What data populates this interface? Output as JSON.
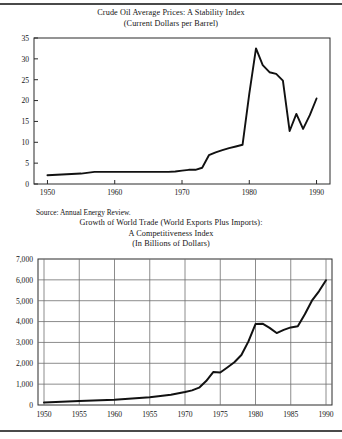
{
  "document": {
    "type": "scanned-report-page",
    "rules": {
      "top": true,
      "bottom": true
    }
  },
  "figure1": {
    "title_line1": "Crude Oil Average Prices: A Stability Index",
    "title_line2": "(Current Dollars per Barrel)",
    "source": "Source: Annual Energy Review."
  },
  "figure2": {
    "title_line1": "Growth of World Trade (World Exports Plus Imports):",
    "title_line2": "A Competitiveness Index",
    "title_line3": "(In Billions of Dollars)"
  },
  "chart_data": [
    {
      "type": "line",
      "title": "Crude Oil Average Prices: A Stability Index",
      "subtitle": "(Current Dollars per Barrel)",
      "xlabel": "",
      "ylabel": "",
      "xlim": [
        1948,
        1992
      ],
      "ylim": [
        0,
        35
      ],
      "grid": false,
      "ticks_inward": true,
      "legend": "none",
      "xticks": [
        1950,
        1960,
        1970,
        1980,
        1990
      ],
      "xtick_labels": [
        "1950",
        "1960",
        "1970",
        "1980",
        "1990"
      ],
      "yticks": [
        0,
        5,
        10,
        15,
        20,
        25,
        30,
        35
      ],
      "ytick_labels": [
        "0",
        "5",
        "10",
        "15",
        "20",
        "25",
        "30",
        "35"
      ],
      "series": [
        {
          "name": "Crude oil average price",
          "x": [
            1950,
            1955,
            1957,
            1960,
            1965,
            1968,
            1969,
            1970,
            1971,
            1972,
            1973,
            1974,
            1975,
            1976,
            1977,
            1978,
            1979,
            1980,
            1981,
            1982,
            1983,
            1984,
            1985,
            1986,
            1987,
            1988,
            1989,
            1990
          ],
          "values": [
            2.1,
            2.5,
            2.9,
            2.9,
            2.9,
            2.9,
            3.0,
            3.2,
            3.4,
            3.4,
            3.9,
            6.9,
            7.6,
            8.1,
            8.6,
            9.0,
            9.4,
            21.6,
            32.5,
            28.5,
            26.8,
            26.4,
            24.8,
            12.7,
            16.8,
            13.2,
            16.5,
            20.5
          ]
        }
      ]
    },
    {
      "type": "line",
      "title": "Growth of World Trade (World Exports Plus Imports): A Competitiveness Index",
      "subtitle": "(In Billions of Dollars)",
      "xlabel": "",
      "ylabel": "",
      "xlim": [
        1950,
        1990
      ],
      "ylim": [
        0,
        7000
      ],
      "grid": true,
      "legend": "none",
      "xticks": [
        1950,
        1955,
        1960,
        1965,
        1970,
        1975,
        1980,
        1985,
        1990
      ],
      "xtick_labels": [
        "1950",
        "1955",
        "1960",
        "1955",
        "1970",
        "1975",
        "1980",
        "1985",
        "1990"
      ],
      "yticks": [
        0,
        1000,
        2000,
        3000,
        4000,
        5000,
        6000,
        7000
      ],
      "ytick_labels": [
        "0",
        "1,000",
        "2,000",
        "3,000",
        "4,000",
        "5,000",
        "6,000",
        "7,000"
      ],
      "series": [
        {
          "name": "World exports plus imports",
          "x": [
            1950,
            1955,
            1960,
            1965,
            1968,
            1970,
            1971,
            1972,
            1973,
            1974,
            1975,
            1976,
            1977,
            1978,
            1979,
            1980,
            1981,
            1982,
            1983,
            1984,
            1985,
            1986,
            1987,
            1988,
            1989,
            1990
          ],
          "values": [
            120,
            190,
            255,
            375,
            490,
            620,
            700,
            830,
            1150,
            1580,
            1560,
            1800,
            2050,
            2400,
            3050,
            3880,
            3900,
            3700,
            3450,
            3600,
            3720,
            3780,
            4350,
            5000,
            5450,
            5980
          ]
        }
      ]
    }
  ]
}
